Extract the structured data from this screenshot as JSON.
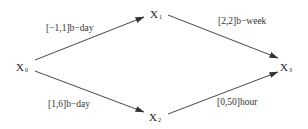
{
  "diagram": {
    "type": "precedence-graph",
    "nodes": [
      {
        "id": "x0",
        "base": "X",
        "sub": "0"
      },
      {
        "id": "x1",
        "base": "X",
        "sub": "1"
      },
      {
        "id": "x2",
        "base": "X",
        "sub": "2"
      },
      {
        "id": "x3",
        "base": "X",
        "sub": "3"
      }
    ],
    "edges": [
      {
        "from": "x0",
        "to": "x1",
        "label": "[−1,1]b−day"
      },
      {
        "from": "x1",
        "to": "x3",
        "label": "[2,2]b−week"
      },
      {
        "from": "x0",
        "to": "x2",
        "label": "[1,6]b−day"
      },
      {
        "from": "x2",
        "to": "x3",
        "label": "[0,50]hour"
      }
    ],
    "colors": {
      "line": "#333333",
      "text": "#222222",
      "background": "#ffffff"
    }
  }
}
